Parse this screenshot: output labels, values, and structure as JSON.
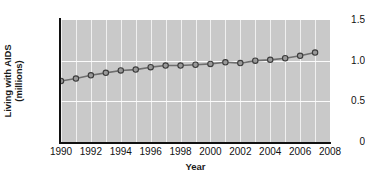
{
  "chart_data": {
    "type": "line",
    "title": "",
    "xlabel": "Year",
    "ylabel": "Living with AIDS (millions)",
    "ylabel_line1": "Living with AIDS",
    "ylabel_line2": "(millions)",
    "xlim": [
      1990,
      2008
    ],
    "ylim": [
      0,
      1.5
    ],
    "grid": true,
    "legend": "none",
    "plot_background": "#c9c9c9",
    "line_color": "#6e6e6e",
    "marker_face_color": "#9a9a9a",
    "marker_edge_color": "#3c3c3c",
    "ytick_labels": [
      "1.5",
      "1.0",
      "0.5",
      "0"
    ],
    "ytick_values": [
      1.5,
      1.0,
      0.5,
      0
    ],
    "xtick_labels": [
      "1990",
      "1992",
      "1994",
      "1996",
      "1998",
      "2000",
      "2002",
      "2004",
      "2006",
      "2008"
    ],
    "xtick_values": [
      1990,
      1992,
      1994,
      1996,
      1998,
      2000,
      2002,
      2004,
      2006,
      2008
    ],
    "gridline_x_values": [
      1990,
      1991,
      1992,
      1993,
      1994,
      1995,
      1996,
      1997,
      1998,
      1999,
      2000,
      2001,
      2002,
      2003,
      2004,
      2005,
      2006,
      2007,
      2008
    ],
    "gridline_y_values": [
      0.5,
      1.0
    ],
    "x": [
      1990,
      1991,
      1992,
      1993,
      1994,
      1995,
      1996,
      1997,
      1998,
      1999,
      2000,
      2001,
      2002,
      2003,
      2004,
      2005,
      2006,
      2007
    ],
    "values": [
      0.75,
      0.78,
      0.82,
      0.85,
      0.88,
      0.89,
      0.92,
      0.94,
      0.94,
      0.95,
      0.96,
      0.98,
      0.97,
      1.0,
      1.01,
      1.03,
      1.06,
      1.1
    ],
    "series": [
      {
        "name": "Living with AIDS",
        "values": [
          0.75,
          0.78,
          0.82,
          0.85,
          0.88,
          0.89,
          0.92,
          0.94,
          0.94,
          0.95,
          0.96,
          0.98,
          0.97,
          1.0,
          1.01,
          1.03,
          1.06,
          1.1
        ]
      }
    ]
  }
}
